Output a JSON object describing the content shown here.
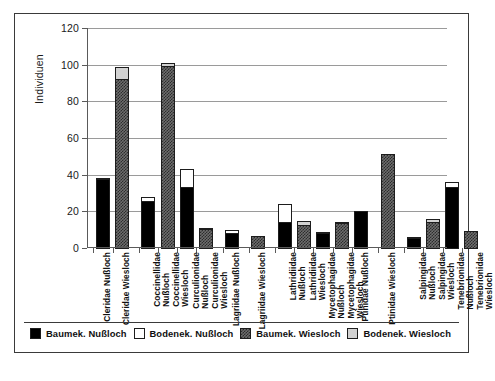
{
  "chart_data": {
    "type": "bar",
    "title": "",
    "xlabel": "",
    "ylabel": "Individuen",
    "ylim": [
      0,
      120
    ],
    "ytick_values": [
      0,
      20,
      40,
      60,
      80,
      100,
      120
    ],
    "ytick_labels": [
      "0",
      "20",
      "40",
      "60",
      "80",
      "100",
      "120"
    ],
    "grid": true,
    "legend_position": "bottom",
    "stacked": true,
    "series": [
      {
        "name": "Baumek. Nußloch",
        "swatch": "sw-black",
        "color": "#000000"
      },
      {
        "name": "Bodenek. Nußloch",
        "swatch": "sw-white",
        "color": "#ffffff"
      },
      {
        "name": "Baumek. Wiesloch",
        "swatch": "sw-dark",
        "color": "#4a4a4a"
      },
      {
        "name": "Bodenek. Wiesloch",
        "swatch": "sw-light",
        "color": "#d2d2d2"
      }
    ],
    "categories": [
      "Cleridae Nußloch",
      "Cleridae Wiesloch",
      "Coccinellidae Nußloch",
      "Coccinellidae Wiesloch",
      "Curculionidae Nußloch",
      "Curculionidae Wiesloch",
      "Lagriidae Nußloch",
      "Lagriidae Wiesloch",
      "Lathridiidae Nußloch",
      "Lathridiidae Wiesloch",
      "Mycetophagidae Nußloch",
      "Mycetophagidae Wiesloch",
      "Ptinidae Nußloch",
      "Ptinidae Wiesloch",
      "Salpingidae Nußloch",
      "Salpingidae Wiesloch",
      "Tenebrionidae Nußloch",
      "Tenebrionidae Wiesloch"
    ],
    "bars": [
      {
        "label": "Cleridae Nußloch",
        "label_lines": [
          "Cleridae Nußloch"
        ],
        "gap_before": 0,
        "segments": [
          {
            "series": "Baumek. Nußloch",
            "swatch": "sw-black",
            "value": 38
          },
          {
            "series": "Bodenek. Nußloch",
            "swatch": "sw-white",
            "value": 1
          }
        ],
        "total": 39
      },
      {
        "label": "Cleridae Wiesloch",
        "label_lines": [
          "Cleridae Wiesloch"
        ],
        "gap_before": 0,
        "segments": [
          {
            "series": "Baumek. Wiesloch",
            "swatch": "sw-dark",
            "value": 93
          },
          {
            "series": "Bodenek. Wiesloch",
            "swatch": "sw-light",
            "value": 7
          }
        ],
        "total": 100
      },
      {
        "label": "Coccinellidae Nußloch",
        "label_lines": [
          "Coccinellidae",
          "Nußloch"
        ],
        "gap_before": 1,
        "segments": [
          {
            "series": "Baumek. Nußloch",
            "swatch": "sw-black",
            "value": 26
          },
          {
            "series": "Bodenek. Nußloch",
            "swatch": "sw-white",
            "value": 3
          }
        ],
        "total": 29
      },
      {
        "label": "Coccinellidae Wiesloch",
        "label_lines": [
          "Coccinellidae",
          "Wiesloch"
        ],
        "gap_before": 0,
        "segments": [
          {
            "series": "Baumek. Wiesloch",
            "swatch": "sw-dark",
            "value": 100
          },
          {
            "series": "Bodenek. Wiesloch",
            "swatch": "sw-light",
            "value": 2
          }
        ],
        "total": 102
      },
      {
        "label": "Curculionidae Nußloch",
        "label_lines": [
          "Curculionidae",
          "Nußloch"
        ],
        "gap_before": 0,
        "segments": [
          {
            "series": "Baumek. Nußloch",
            "swatch": "sw-black",
            "value": 34
          },
          {
            "series": "Bodenek. Nußloch",
            "swatch": "sw-white",
            "value": 10
          }
        ],
        "total": 44
      },
      {
        "label": "Curculionidae Wiesloch",
        "label_lines": [
          "Curculionidae",
          "Wiesloch"
        ],
        "gap_before": 0,
        "segments": [
          {
            "series": "Baumek. Wiesloch",
            "swatch": "sw-dark",
            "value": 11
          },
          {
            "series": "Bodenek. Wiesloch",
            "swatch": "sw-light",
            "value": 1
          }
        ],
        "total": 12
      },
      {
        "label": "Lagriidae Nußloch",
        "label_lines": [
          "Lagriidae Nußloch"
        ],
        "gap_before": 1,
        "segments": [
          {
            "series": "Baumek. Nußloch",
            "swatch": "sw-black",
            "value": 9
          },
          {
            "series": "Bodenek. Nußloch",
            "swatch": "sw-white",
            "value": 2
          }
        ],
        "total": 11
      },
      {
        "label": "Lagriidae Wiesloch",
        "label_lines": [
          "Lagriidae Wiesloch"
        ],
        "gap_before": 1,
        "segments": [
          {
            "series": "Baumek. Wiesloch",
            "swatch": "sw-dark",
            "value": 7
          },
          {
            "series": "Bodenek. Wiesloch",
            "swatch": "sw-light",
            "value": 0
          }
        ],
        "total": 7
      },
      {
        "label": "Lathridiidae Nußloch",
        "label_lines": [
          "Lathridiidae",
          "Nußloch"
        ],
        "gap_before": 1,
        "segments": [
          {
            "series": "Baumek. Nußloch",
            "swatch": "sw-black",
            "value": 15
          },
          {
            "series": "Bodenek. Nußloch",
            "swatch": "sw-white",
            "value": 10
          }
        ],
        "total": 25
      },
      {
        "label": "Lathridiidae Wiesloch",
        "label_lines": [
          "Lathridiidae",
          "Wiesloch"
        ],
        "gap_before": 0,
        "segments": [
          {
            "series": "Baumek. Wiesloch",
            "swatch": "sw-dark",
            "value": 13
          },
          {
            "series": "Bodenek. Wiesloch",
            "swatch": "sw-light",
            "value": 3
          }
        ],
        "total": 16
      },
      {
        "label": "Mycetophagidae Nußloch",
        "label_lines": [
          "Mycetophagidae",
          "Nußloch"
        ],
        "gap_before": 0,
        "segments": [
          {
            "series": "Baumek. Nußloch",
            "swatch": "sw-black",
            "value": 9
          },
          {
            "series": "Bodenek. Nußloch",
            "swatch": "sw-white",
            "value": 1
          }
        ],
        "total": 10
      },
      {
        "label": "Mycetophagidae Wiesloch",
        "label_lines": [
          "Mycetophagidae",
          "Wiesloch"
        ],
        "gap_before": 0,
        "segments": [
          {
            "series": "Baumek. Wiesloch",
            "swatch": "sw-dark",
            "value": 14
          },
          {
            "series": "Bodenek. Wiesloch",
            "swatch": "sw-light",
            "value": 1
          }
        ],
        "total": 15
      },
      {
        "label": "Ptinidae Nußloch",
        "label_lines": [
          "Ptinidae Nußloch"
        ],
        "gap_before": 0,
        "segments": [
          {
            "series": "Baumek. Nußloch",
            "swatch": "sw-black",
            "value": 21
          },
          {
            "series": "Bodenek. Nußloch",
            "swatch": "sw-white",
            "value": 0
          }
        ],
        "total": 21
      },
      {
        "label": "Ptinidae Wiesloch",
        "label_lines": [
          "Ptinidae Wiesloch"
        ],
        "gap_before": 1,
        "segments": [
          {
            "series": "Baumek. Wiesloch",
            "swatch": "sw-dark",
            "value": 52
          },
          {
            "series": "Bodenek. Wiesloch",
            "swatch": "sw-light",
            "value": 0
          }
        ],
        "total": 52
      },
      {
        "label": "Salpingidae Nußloch",
        "label_lines": [
          "Salpingidae",
          "Nußloch"
        ],
        "gap_before": 1,
        "segments": [
          {
            "series": "Baumek. Nußloch",
            "swatch": "sw-black",
            "value": 6
          },
          {
            "series": "Bodenek. Nußloch",
            "swatch": "sw-white",
            "value": 1
          }
        ],
        "total": 7
      },
      {
        "label": "Salpingidae Wiesloch",
        "label_lines": [
          "Salpingidae",
          "Wiesloch"
        ],
        "gap_before": 0,
        "segments": [
          {
            "series": "Baumek. Wiesloch",
            "swatch": "sw-dark",
            "value": 15
          },
          {
            "series": "Bodenek. Wiesloch",
            "swatch": "sw-light",
            "value": 2
          }
        ],
        "total": 17
      },
      {
        "label": "Tenebrionidae Nußloch",
        "label_lines": [
          "Tenebrionidae",
          "Nußloch"
        ],
        "gap_before": 0,
        "segments": [
          {
            "series": "Baumek. Nußloch",
            "swatch": "sw-black",
            "value": 34
          },
          {
            "series": "Bodenek. Nußloch",
            "swatch": "sw-white",
            "value": 3
          }
        ],
        "total": 37
      },
      {
        "label": "Tenebrionidae Wiesloch",
        "label_lines": [
          "Tenebrionidae",
          "Wiesloch"
        ],
        "gap_before": 0,
        "segments": [
          {
            "series": "Baumek. Wiesloch",
            "swatch": "sw-dark",
            "value": 10
          },
          {
            "series": "Bodenek. Wiesloch",
            "swatch": "sw-light",
            "value": 0
          }
        ],
        "total": 10
      }
    ]
  }
}
